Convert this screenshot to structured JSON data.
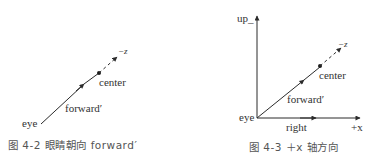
{
  "figures": [
    {
      "id": "fig-4-2",
      "labels": {
        "eye": "eye",
        "forward": "forward′",
        "center": "center",
        "neg_z": "−z"
      },
      "caption": "图 4-2   眼睛朝向 forward′"
    },
    {
      "id": "fig-4-3",
      "labels": {
        "up": "up_",
        "eye": "eye",
        "forward": "forward′",
        "center": "center",
        "neg_z": "−z",
        "right": "right",
        "pos_x": "+x"
      },
      "caption": "图 4-3   ＋x 轴方向"
    }
  ],
  "colors": {
    "line": "#2b2b2b",
    "text": "#333333",
    "caption": "#555555"
  }
}
